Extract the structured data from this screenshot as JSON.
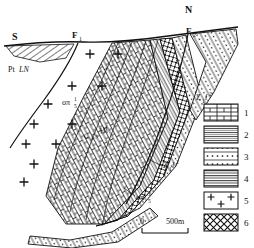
{
  "figure": {
    "type": "geological-cross-section",
    "orientation": {
      "left_label": "S",
      "right_label": "N"
    },
    "faults": [
      {
        "name": "fault-f1",
        "label": "F",
        "sub": "1"
      },
      {
        "name": "fault-f2",
        "label": "F",
        "sub": "2"
      }
    ],
    "unit_labels": [
      {
        "name": "unit-ptln",
        "text": "Pt",
        "italic": "LN",
        "sub": "",
        "sup": ""
      },
      {
        "name": "unit-granite-1",
        "text": "oπ",
        "italic": "",
        "sub": "5",
        "sup": "1"
      },
      {
        "name": "unit-carbon",
        "text": "C",
        "italic": "Hf",
        "sub": "2-3",
        "sup": ""
      },
      {
        "name": "unit-sinian-1",
        "text": "Z",
        "italic": "l",
        "sub": "1",
        "sup": "2"
      },
      {
        "name": "unit-sinian-2",
        "text": "Z",
        "italic": "l",
        "sub": "1",
        "sup": "2"
      },
      {
        "name": "unit-granite-2",
        "text": "oπ",
        "italic": "",
        "sub": "5",
        "sup": "1"
      }
    ],
    "scalebar": {
      "start": "0",
      "end": "500m"
    },
    "legend": {
      "items": [
        {
          "num": "1",
          "pattern": "brick",
          "desc": "limestone"
        },
        {
          "num": "2",
          "pattern": "lines",
          "desc": "banded-shale"
        },
        {
          "num": "3",
          "pattern": "dotted",
          "desc": "sandstone"
        },
        {
          "num": "4",
          "pattern": "lines-gray",
          "desc": "marl"
        },
        {
          "num": "5",
          "pattern": "plus",
          "desc": "granite"
        },
        {
          "num": "6",
          "pattern": "crosshatch",
          "desc": "fault-zone"
        }
      ]
    },
    "colors": {
      "ink": "#111111",
      "paper": "#ffffff",
      "gray": "#9a9a9a",
      "dark": "#3a3a3a"
    }
  }
}
